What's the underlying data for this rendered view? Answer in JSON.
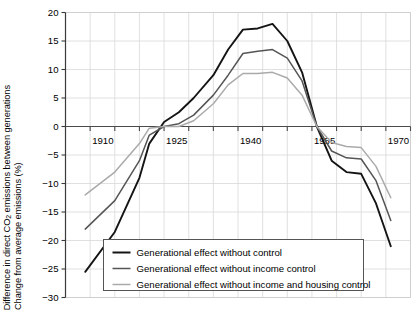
{
  "axes": {
    "ylabel_line1_pre": "Difference in direct CO",
    "ylabel_line1_sub": "2",
    "ylabel_line1_post": " emissions between generations",
    "ylabel_line2": "Change from average emissions (%)",
    "xtick_labels": [
      "1910",
      "1925",
      "1940",
      "1955",
      "1970"
    ],
    "ytick_labels": [
      "20",
      "15",
      "10",
      "5",
      "0",
      "−5",
      "−10",
      "−15",
      "−20",
      "−25",
      "−30"
    ]
  },
  "legend": {
    "entries": [
      {
        "label": "Generational effect without control",
        "color": "#141414"
      },
      {
        "label": "Generational effect without income control",
        "color": "#555555"
      },
      {
        "label": "Generational effect without income and housing control",
        "color": "#aaaaaa"
      }
    ]
  },
  "chart_data": {
    "type": "line",
    "title": "",
    "xlabel": "",
    "ylabel": "Difference in direct CO2 emissions between generations / Change from average emissions (%)",
    "xlim": [
      1905,
      1975
    ],
    "ylim": [
      -30,
      20
    ],
    "xticks": [
      1905,
      1910,
      1915,
      1920,
      1925,
      1930,
      1935,
      1940,
      1945,
      1950,
      1955,
      1960,
      1965,
      1970,
      1975
    ],
    "xtick_major": [
      1910,
      1925,
      1940,
      1955,
      1970
    ],
    "yticks": [
      -30,
      -25,
      -20,
      -15,
      -10,
      -5,
      0,
      5,
      10,
      15,
      20
    ],
    "grid": true,
    "legend_position": "bottom-center",
    "zero_line": 0,
    "series": [
      {
        "name": "Generational effect without control",
        "color": "#141414",
        "x": [
          1909,
          1915,
          1920,
          1922,
          1925,
          1928,
          1931,
          1935,
          1938,
          1941,
          1944,
          1947,
          1950,
          1953,
          1956,
          1959,
          1962,
          1965,
          1968,
          1971
        ],
        "y": [
          -25.5,
          -18.5,
          -9.0,
          -3.0,
          0.8,
          2.5,
          5.0,
          9.0,
          13.5,
          17.0,
          17.2,
          18.0,
          15.0,
          9.5,
          0.0,
          -6.0,
          -8.0,
          -8.3,
          -13.5,
          -21.0
        ]
      },
      {
        "name": "Generational effect without income control",
        "color": "#555555",
        "x": [
          1909,
          1915,
          1920,
          1922,
          1925,
          1928,
          1931,
          1935,
          1938,
          1941,
          1944,
          1947,
          1950,
          1953,
          1956,
          1959,
          1962,
          1965,
          1968,
          1971
        ],
        "y": [
          -18.0,
          -13.0,
          -6.0,
          -1.5,
          0.0,
          0.5,
          2.0,
          5.5,
          9.0,
          12.8,
          13.2,
          13.5,
          12.0,
          8.0,
          0.0,
          -4.3,
          -5.5,
          -5.7,
          -9.5,
          -16.5
        ]
      },
      {
        "name": "Generational effect without income and housing control",
        "color": "#aaaaaa",
        "x": [
          1909,
          1915,
          1920,
          1922,
          1925,
          1928,
          1931,
          1935,
          1938,
          1941,
          1944,
          1947,
          1950,
          1953,
          1956,
          1959,
          1962,
          1965,
          1968,
          1971
        ],
        "y": [
          -12.0,
          -8.0,
          -3.0,
          -0.3,
          0.0,
          0.0,
          1.0,
          4.0,
          7.3,
          9.3,
          9.3,
          9.5,
          8.5,
          5.5,
          0.0,
          -2.8,
          -3.5,
          -3.7,
          -7.0,
          -12.5
        ]
      }
    ]
  }
}
